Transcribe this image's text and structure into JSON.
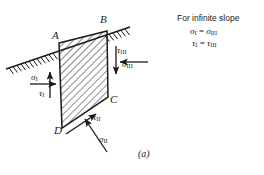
{
  "figure": {
    "caption": "(a)",
    "type": "infinite-slope-free-body-diagram",
    "colors": {
      "line": "#1a1a1a",
      "hatch": "#333333",
      "background": "#ffffff"
    }
  },
  "note": {
    "title": "For infinite slope",
    "equation_sigma": "σ",
    "equation_sigma_sub_left": "I",
    "equation_sigma_eq": " = ",
    "equation_sigma_right": "σ",
    "equation_sigma_sub_right": "III",
    "equation_tau": "τ",
    "equation_tau_sub_left": "I",
    "equation_tau_eq": " = ",
    "equation_tau_right": "τ",
    "equation_tau_sub_right": "III"
  },
  "corners": {
    "a": "A",
    "b": "B",
    "c": "C",
    "d": "D"
  },
  "stresses": {
    "sigma_1": {
      "symbol": "σ",
      "sub": "I",
      "direction": "right"
    },
    "tau_1": {
      "symbol": "τ",
      "sub": "I",
      "direction": "up"
    },
    "sigma_2": {
      "symbol": "σ",
      "sub": "II",
      "direction": "up-right"
    },
    "tau_2": {
      "symbol": "τ",
      "sub": "II",
      "direction": "up-right-along-base"
    },
    "sigma_3": {
      "symbol": "σ",
      "sub": "III",
      "direction": "left"
    },
    "tau_3": {
      "symbol": "τ",
      "sub": "III",
      "direction": "down"
    }
  },
  "geometry": {
    "block_vertices": "A(59,43) B(107,31) C(108,97) D(62,128)",
    "slope_line": "from (8,68) to (128,27)"
  }
}
